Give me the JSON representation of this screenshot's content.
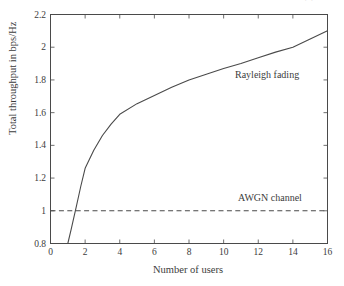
{
  "figure": {
    "top_fragment": "·  ·",
    "background_color": "#ffffff",
    "ink_color": "#4a4a4a"
  },
  "chart_data": {
    "type": "line",
    "title": "",
    "subtitle": "",
    "xlabel": "Number of users",
    "ylabel": "Total throughput in bps/Hz",
    "xlim": [
      0,
      16
    ],
    "ylim": [
      0.8,
      2.2
    ],
    "xticks": [
      0,
      2,
      4,
      6,
      8,
      10,
      12,
      14,
      16
    ],
    "xtick_labels": [
      "0",
      "2",
      "4",
      "6",
      "8",
      "10",
      "12",
      "14",
      "16"
    ],
    "yticks": [
      0.8,
      1.0,
      1.2,
      1.4,
      1.6,
      1.8,
      2.0,
      2.2
    ],
    "ytick_labels": [
      "0.8",
      "1",
      "1.2",
      "1.4",
      "1.6",
      "1.8",
      "2",
      "2.2"
    ],
    "grid": false,
    "legend_position": "inline-annotation",
    "series": [
      {
        "name": "Rayleigh fading",
        "style": "solid",
        "color": "#4a4a4a",
        "annotation": "Rayleigh fading",
        "x": [
          1.0,
          1.2,
          1.5,
          1.75,
          2.0,
          2.5,
          3.0,
          3.5,
          4.0,
          5.0,
          6.0,
          7.0,
          8.0,
          9.0,
          10.0,
          11.0,
          12.0,
          13.0,
          14.0,
          15.0,
          16.0
        ],
        "y": [
          0.8,
          0.89,
          1.03,
          1.15,
          1.26,
          1.37,
          1.46,
          1.53,
          1.59,
          1.655,
          1.705,
          1.755,
          1.8,
          1.835,
          1.87,
          1.9,
          1.935,
          1.97,
          2.0,
          2.05,
          2.1
        ]
      },
      {
        "name": "AWGN channel",
        "style": "dashed",
        "color": "#4a4a4a",
        "annotation": "AWGN channel",
        "x": [
          0,
          16
        ],
        "y": [
          1.0,
          1.0
        ]
      }
    ]
  }
}
